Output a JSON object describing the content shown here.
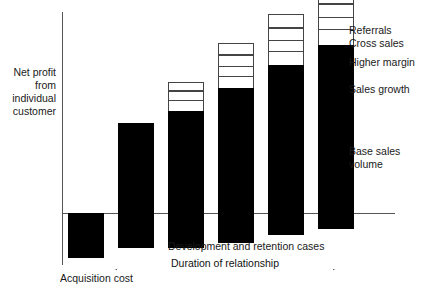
{
  "chart_data": {
    "type": "bar",
    "title": "",
    "subtitle": "",
    "xlabel": "Duration of relationship",
    "ylabel": "Net profit from individual customer",
    "grid": false,
    "legend_position": "right",
    "axis_zero_label": "0",
    "categories": [
      "Acquisition",
      "Year 1",
      "Year 2",
      "Year 3",
      "Year 4",
      "Year 5"
    ],
    "stack_order": [
      "Base sales volume",
      "Sales growth",
      "Higher margin",
      "Cross sales",
      "Referrals"
    ],
    "series": [
      {
        "name": "Base sales volume",
        "values": [
          -45,
          90,
          102,
          125,
          148,
          168
        ]
      },
      {
        "name": "Sales growth",
        "values": [
          0,
          0,
          11,
          12,
          14,
          16
        ]
      },
      {
        "name": "Higher margin",
        "values": [
          0,
          0,
          9,
          10,
          11,
          12
        ]
      },
      {
        "name": "Cross sales",
        "values": [
          0,
          0,
          9,
          11,
          12,
          13
        ]
      },
      {
        "name": "Referrals",
        "values": [
          0,
          0,
          0,
          12,
          14,
          16
        ]
      }
    ],
    "notes": [
      "Acquisition cost",
      "Development and retention cases",
      "Duration of relationship"
    ]
  },
  "axes": {
    "y_label_lines": [
      "Net profit",
      "from",
      "individual",
      "customer"
    ]
  },
  "legend": {
    "items": [
      {
        "label": "Referrals"
      },
      {
        "label": "Cross sales"
      },
      {
        "label": "Higher margin"
      },
      {
        "label": "Sales growth"
      },
      {
        "label": "Base sales volume"
      }
    ],
    "base_label_lines": [
      "Base sales",
      "volume"
    ]
  },
  "annotations": {
    "acquisition_cost": "Acquisition cost",
    "development_cases": "Development and retention cases",
    "duration": "Duration of relationship"
  }
}
